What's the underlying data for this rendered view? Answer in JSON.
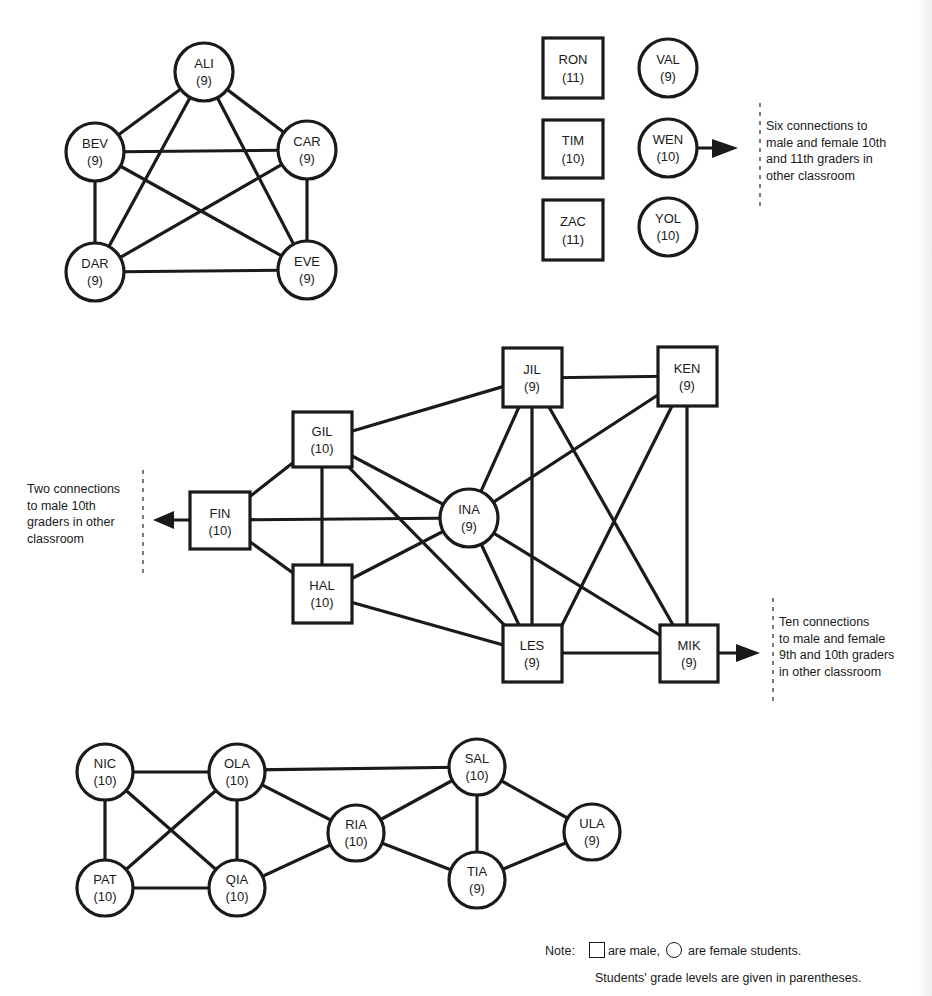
{
  "diagram": {
    "type": "sociogram",
    "nodes": {
      "ALI": {
        "name": "ALI",
        "grade": "(9)",
        "sex": "female"
      },
      "BEV": {
        "name": "BEV",
        "grade": "(9)",
        "sex": "female"
      },
      "CAR": {
        "name": "CAR",
        "grade": "(9)",
        "sex": "female"
      },
      "DAR": {
        "name": "DAR",
        "grade": "(9)",
        "sex": "female"
      },
      "EVE": {
        "name": "EVE",
        "grade": "(9)",
        "sex": "female"
      },
      "RON": {
        "name": "RON",
        "grade": "(11)",
        "sex": "male"
      },
      "TIM": {
        "name": "TIM",
        "grade": "(10)",
        "sex": "male"
      },
      "ZAC": {
        "name": "ZAC",
        "grade": "(11)",
        "sex": "male"
      },
      "VAL": {
        "name": "VAL",
        "grade": "(9)",
        "sex": "female"
      },
      "WEN": {
        "name": "WEN",
        "grade": "(10)",
        "sex": "female"
      },
      "YOL": {
        "name": "YOL",
        "grade": "(10)",
        "sex": "female"
      },
      "FIN": {
        "name": "FIN",
        "grade": "(10)",
        "sex": "male"
      },
      "GIL": {
        "name": "GIL",
        "grade": "(10)",
        "sex": "male"
      },
      "HAL": {
        "name": "HAL",
        "grade": "(10)",
        "sex": "male"
      },
      "INA": {
        "name": "INA",
        "grade": "(9)",
        "sex": "female"
      },
      "JIL": {
        "name": "JIL",
        "grade": "(9)",
        "sex": "male"
      },
      "KEN": {
        "name": "KEN",
        "grade": "(9)",
        "sex": "male"
      },
      "LES": {
        "name": "LES",
        "grade": "(9)",
        "sex": "male"
      },
      "MIK": {
        "name": "MIK",
        "grade": "(9)",
        "sex": "male"
      },
      "NIC": {
        "name": "NIC",
        "grade": "(10)",
        "sex": "female"
      },
      "OLA": {
        "name": "OLA",
        "grade": "(10)",
        "sex": "female"
      },
      "PAT": {
        "name": "PAT",
        "grade": "(10)",
        "sex": "female"
      },
      "QIA": {
        "name": "QIA",
        "grade": "(10)",
        "sex": "female"
      },
      "RIA": {
        "name": "RIA",
        "grade": "(10)",
        "sex": "female"
      },
      "SAL": {
        "name": "SAL",
        "grade": "(10)",
        "sex": "female"
      },
      "TIA": {
        "name": "TIA",
        "grade": "(9)",
        "sex": "female"
      },
      "ULA": {
        "name": "ULA",
        "grade": "(9)",
        "sex": "female"
      }
    },
    "edges": [
      [
        "ALI",
        "BEV"
      ],
      [
        "ALI",
        "CAR"
      ],
      [
        "ALI",
        "DAR"
      ],
      [
        "ALI",
        "EVE"
      ],
      [
        "BEV",
        "CAR"
      ],
      [
        "BEV",
        "DAR"
      ],
      [
        "BEV",
        "EVE"
      ],
      [
        "CAR",
        "DAR"
      ],
      [
        "CAR",
        "EVE"
      ],
      [
        "DAR",
        "EVE"
      ],
      [
        "FIN",
        "GIL"
      ],
      [
        "FIN",
        "HAL"
      ],
      [
        "FIN",
        "INA"
      ],
      [
        "GIL",
        "HAL"
      ],
      [
        "GIL",
        "JIL"
      ],
      [
        "GIL",
        "INA"
      ],
      [
        "GIL",
        "LES"
      ],
      [
        "HAL",
        "INA"
      ],
      [
        "HAL",
        "LES"
      ],
      [
        "INA",
        "JIL"
      ],
      [
        "INA",
        "KEN"
      ],
      [
        "INA",
        "LES"
      ],
      [
        "INA",
        "MIK"
      ],
      [
        "JIL",
        "KEN"
      ],
      [
        "JIL",
        "LES"
      ],
      [
        "JIL",
        "MIK"
      ],
      [
        "KEN",
        "LES"
      ],
      [
        "KEN",
        "MIK"
      ],
      [
        "LES",
        "MIK"
      ],
      [
        "NIC",
        "OLA"
      ],
      [
        "NIC",
        "PAT"
      ],
      [
        "NIC",
        "QIA"
      ],
      [
        "OLA",
        "PAT"
      ],
      [
        "OLA",
        "QIA"
      ],
      [
        "OLA",
        "SAL"
      ],
      [
        "OLA",
        "RIA"
      ],
      [
        "PAT",
        "QIA"
      ],
      [
        "QIA",
        "RIA"
      ],
      [
        "RIA",
        "SAL"
      ],
      [
        "RIA",
        "TIA"
      ],
      [
        "SAL",
        "TIA"
      ],
      [
        "SAL",
        "ULA"
      ],
      [
        "TIA",
        "ULA"
      ]
    ],
    "external_links": {
      "WEN": "Six connections to\nmale and female 10th\nand 11th graders in\nother classroom",
      "FIN": "Two connections\nto male 10th\ngraders in other\nclassroom",
      "MIK": "Ten connections\nto male and female\n9th and 10th graders\nin other classroom"
    }
  },
  "note": {
    "label": "Note:",
    "male_text": "are male,",
    "female_text": "are female students.",
    "grade_text": "Students' grade levels are given in parentheses."
  },
  "colors": {
    "ink": "#1a1a1a",
    "paper": "#ffffff"
  }
}
